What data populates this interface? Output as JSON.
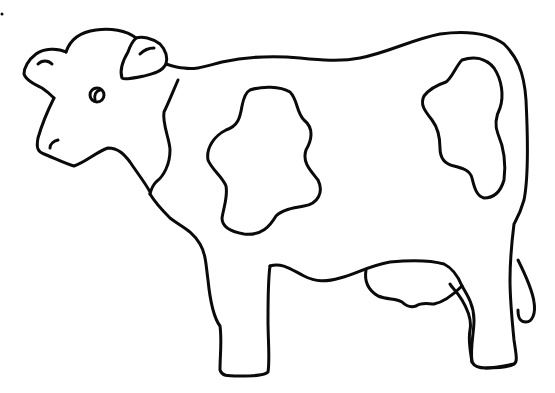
{
  "image": {
    "subject": "cow coloring page outline",
    "style": "black line art on white background",
    "colors": {
      "background": "#ffffff",
      "ink": "#0a0a0a"
    },
    "parts": [
      "head",
      "left-ear",
      "right-ear",
      "eye",
      "nostril",
      "body",
      "spot-front",
      "spot-rear",
      "udder",
      "front-legs",
      "rear-legs",
      "tail"
    ]
  }
}
